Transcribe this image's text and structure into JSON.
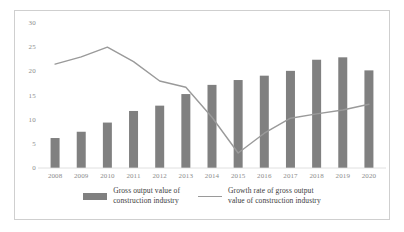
{
  "chart_data": {
    "type": "bar",
    "title": "",
    "subtitle": "",
    "xlabel": "",
    "ylabel": "",
    "categories": [
      "2008",
      "2009",
      "2010",
      "2011",
      "2012",
      "2013",
      "2014",
      "2015",
      "2016",
      "2017",
      "2018",
      "2019",
      "2020"
    ],
    "ylim": [
      0,
      30
    ],
    "yticks": [
      0,
      5,
      10,
      15,
      20,
      25,
      30
    ],
    "grid": false,
    "legend_position": "bottom",
    "series": [
      {
        "name": "Gross output value of\nconstruction industry",
        "type": "bar",
        "color": "#808080",
        "values": [
          6.2,
          7.5,
          9.4,
          11.8,
          12.9,
          15.3,
          17.2,
          18.2,
          19.1,
          20.1,
          22.4,
          22.9,
          20.2
        ]
      },
      {
        "name": "Growth rate of gross output\nvalue of construction industry",
        "type": "line",
        "color": "#9a9a9a",
        "values": [
          21.5,
          23.0,
          25.0,
          22.0,
          18.0,
          16.7,
          10.5,
          3.1,
          7.2,
          10.3,
          11.2,
          12.0,
          13.2
        ]
      }
    ]
  },
  "legend": {
    "entries": [
      {
        "label": "Gross output value of\nconstruction industry",
        "marker": "bar-swatch"
      },
      {
        "label": "Growth rate of gross output\nvalue of construction industry",
        "marker": "line-swatch"
      }
    ]
  },
  "colors": {
    "bar": "#808080",
    "line": "#9a9a9a",
    "frame": "#cfcfcf",
    "tick_text": "#8c8c8c",
    "legend_text": "#3a3a3a",
    "background": "#ffffff"
  }
}
